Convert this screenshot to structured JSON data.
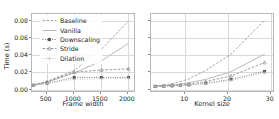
{
  "figure": {
    "background": "#ffffff",
    "series_colors": {
      "Baseline": "#9a9a9a",
      "Vanilla": "#aeaeae",
      "Downscaling": "#555555",
      "Stride": "#8f8f8f",
      "Dilation": "#bdbdbd"
    }
  },
  "legend": {
    "entries": [
      {
        "label": "Baseline",
        "marker": "none",
        "dash": "dashed",
        "color": "#9a9a9a"
      },
      {
        "label": "Vanilla",
        "marker": "none",
        "dash": "solid",
        "color": "#aeaeae"
      },
      {
        "label": "Downscaling",
        "marker": "square",
        "dash": "dotted",
        "color": "#555555"
      },
      {
        "label": "Stride",
        "marker": "tri",
        "dash": "dashed",
        "color": "#8f8f8f"
      },
      {
        "label": "Dilation",
        "marker": "plus",
        "dash": "dotted",
        "color": "#bdbdbd"
      }
    ]
  },
  "chart_data": [
    {
      "id": "frame-width-panel",
      "type": "line",
      "title": "",
      "xlabel": "Frame width",
      "ylabel": "Time (s)",
      "xlim": [
        230,
        2150
      ],
      "ylim": [
        -0.004,
        0.088
      ],
      "xticks": [
        500,
        1000,
        1500,
        2000
      ],
      "xtick_labels": [
        "500",
        "1000",
        "1500",
        "2000"
      ],
      "yticks": [
        0.0,
        0.02,
        0.04,
        0.06,
        0.08
      ],
      "ytick_labels": [
        "0.00",
        "0.02",
        "0.04",
        "0.06",
        "0.08"
      ],
      "grid": true,
      "legend_position": "upper left",
      "x": [
        256,
        512,
        1024,
        1536,
        2048
      ],
      "series": [
        {
          "name": "Baseline",
          "values": [
            0.0035,
            0.0075,
            0.0205,
            0.0455,
            0.08
          ]
        },
        {
          "name": "Vanilla",
          "values": [
            0.003,
            0.0065,
            0.0175,
            0.032,
            0.053
          ]
        },
        {
          "name": "Downscaling",
          "values": [
            0.0028,
            0.0052,
            0.0122,
            0.0122,
            0.0122
          ]
        },
        {
          "name": "Stride",
          "values": [
            0.0032,
            0.007,
            0.0185,
            0.021,
            0.0225
          ]
        },
        {
          "name": "Dilation",
          "values": [
            0.0028,
            0.005,
            0.0098,
            0.0105,
            0.011
          ]
        }
      ]
    },
    {
      "id": "kernel-size-panel",
      "type": "line",
      "title": "",
      "xlabel": "Kernel size",
      "ylabel": "",
      "xlim": [
        2.0,
        31.0
      ],
      "ylim": [
        -0.004,
        0.088
      ],
      "xticks": [
        10,
        20,
        30
      ],
      "xtick_labels": [
        "10",
        "20",
        "30"
      ],
      "yticks": [
        0.0,
        0.02,
        0.04,
        0.06,
        0.08
      ],
      "ytick_labels": [
        "",
        "",
        "",
        "",
        ""
      ],
      "grid": true,
      "legend_position": "upper left",
      "x": [
        3,
        5,
        7,
        9,
        11,
        15,
        21,
        29
      ],
      "series": [
        {
          "name": "Baseline",
          "values": [
            0.002,
            0.003,
            0.0048,
            0.0072,
            0.0105,
            0.0205,
            0.04,
            0.0805
          ]
        },
        {
          "name": "Vanilla",
          "values": [
            0.0018,
            0.0024,
            0.0032,
            0.0042,
            0.0058,
            0.0098,
            0.019,
            0.04
          ]
        },
        {
          "name": "Downscaling",
          "values": [
            0.0015,
            0.0018,
            0.0022,
            0.0026,
            0.0032,
            0.0052,
            0.0098,
            0.0195
          ]
        },
        {
          "name": "Stride",
          "values": [
            0.0016,
            0.002,
            0.0026,
            0.0033,
            0.0042,
            0.0072,
            0.014,
            0.03
          ]
        },
        {
          "name": "Dilation",
          "values": [
            0.0014,
            0.0017,
            0.002,
            0.0024,
            0.0029,
            0.0046,
            0.0086,
            0.0175
          ]
        }
      ]
    }
  ]
}
